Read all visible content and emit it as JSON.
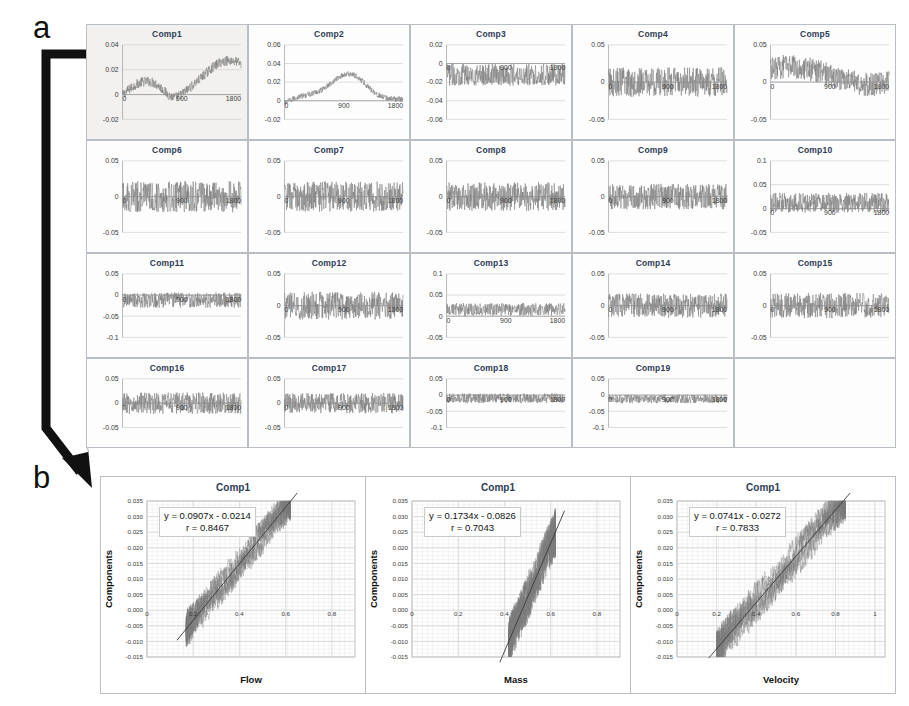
{
  "figure": {
    "panel_a_letter": "a",
    "panel_b_letter": "b",
    "arrow_name": "arrow-from-comp1-to-panel-b"
  },
  "chart_data": [
    {
      "type": "line",
      "title": "Comp1",
      "xlabel": "",
      "ylabel": "",
      "xticks": [
        "0",
        "900",
        "1800"
      ],
      "yticks": [
        "0.04",
        "0.02",
        "0",
        "-0.02"
      ],
      "xlim": [
        0,
        1800
      ],
      "ylim": [
        -0.02,
        0.04
      ],
      "grid": true,
      "series_shape": "rising-trend",
      "noise": 0.004,
      "highlighted": true
    },
    {
      "type": "line",
      "title": "Comp2",
      "xticks": [
        "0",
        "900",
        "1800"
      ],
      "yticks": [
        "0.06",
        "0.04",
        "0.02",
        "0",
        "-0.02"
      ],
      "xlim": [
        0,
        1800
      ],
      "ylim": [
        -0.02,
        0.06
      ],
      "grid": true,
      "series_shape": "hump",
      "noise": 0.003
    },
    {
      "type": "line",
      "title": "Comp3",
      "xticks": [
        "0",
        "900",
        "1800"
      ],
      "yticks": [
        "0.02",
        "0",
        "-0.02",
        "-0.04",
        "-0.06"
      ],
      "xlim": [
        0,
        1800
      ],
      "ylim": [
        -0.06,
        0.02
      ],
      "grid": true,
      "series_shape": "noise",
      "noise": 0.012,
      "baseline": -0.012
    },
    {
      "type": "line",
      "title": "Comp4",
      "xticks": [
        "0",
        "900",
        "1800"
      ],
      "yticks": [
        "0.05",
        "0",
        "-0.05"
      ],
      "xlim": [
        0,
        1800
      ],
      "ylim": [
        -0.05,
        0.05
      ],
      "grid": true,
      "series_shape": "noise",
      "noise": 0.02
    },
    {
      "type": "line",
      "title": "Comp5",
      "xticks": [
        "0",
        "900",
        "1800"
      ],
      "yticks": [
        "0.05",
        "0",
        "-0.05"
      ],
      "xlim": [
        0,
        1800
      ],
      "ylim": [
        -0.05,
        0.05
      ],
      "grid": true,
      "series_shape": "wander",
      "noise": 0.016
    },
    {
      "type": "line",
      "title": "Comp6",
      "xticks": [
        "0",
        "900",
        "1800"
      ],
      "yticks": [
        "0.05",
        "0",
        "-0.05"
      ],
      "xlim": [
        0,
        1800
      ],
      "ylim": [
        -0.05,
        0.05
      ],
      "grid": true,
      "series_shape": "noise",
      "noise": 0.022
    },
    {
      "type": "line",
      "title": "Comp7",
      "xticks": [
        "0",
        "900",
        "1800"
      ],
      "yticks": [
        "0.05",
        "0",
        "-0.05"
      ],
      "xlim": [
        0,
        1800
      ],
      "ylim": [
        -0.05,
        0.05
      ],
      "grid": true,
      "series_shape": "noise",
      "noise": 0.021
    },
    {
      "type": "line",
      "title": "Comp8",
      "xticks": [
        "0",
        "900",
        "1800"
      ],
      "yticks": [
        "0.05",
        "0",
        "-0.05"
      ],
      "xlim": [
        0,
        1800
      ],
      "ylim": [
        -0.05,
        0.05
      ],
      "grid": true,
      "series_shape": "noise",
      "noise": 0.02
    },
    {
      "type": "line",
      "title": "Comp9",
      "xticks": [
        "0",
        "900",
        "1800"
      ],
      "yticks": [
        "0.05",
        "0",
        "-0.05"
      ],
      "xlim": [
        0,
        1800
      ],
      "ylim": [
        -0.05,
        0.05
      ],
      "grid": true,
      "series_shape": "noise",
      "noise": 0.018
    },
    {
      "type": "line",
      "title": "Comp10",
      "xticks": [
        "0",
        "900",
        "1800"
      ],
      "yticks": [
        "0.1",
        "0.05",
        "0",
        "-0.05"
      ],
      "xlim": [
        0,
        1800
      ],
      "ylim": [
        -0.05,
        0.1
      ],
      "grid": true,
      "series_shape": "noise",
      "noise": 0.021,
      "baseline": 0.012
    },
    {
      "type": "line",
      "title": "Comp11",
      "xticks": [
        "0",
        "900",
        "1800"
      ],
      "yticks": [
        "0.05",
        "0",
        "-0.05",
        "-0.1"
      ],
      "xlim": [
        0,
        1800
      ],
      "ylim": [
        -0.1,
        0.05
      ],
      "grid": true,
      "series_shape": "noise",
      "noise": 0.018,
      "baseline": -0.012
    },
    {
      "type": "line",
      "title": "Comp12",
      "xticks": [
        "0",
        "900",
        "1800"
      ],
      "yticks": [
        "0.05",
        "0",
        "-0.05"
      ],
      "xlim": [
        0,
        1800
      ],
      "ylim": [
        -0.05,
        0.05
      ],
      "grid": true,
      "series_shape": "noise",
      "noise": 0.022
    },
    {
      "type": "line",
      "title": "Comp13",
      "xticks": [
        "0",
        "900",
        "1800"
      ],
      "yticks": [
        "0.1",
        "0.05",
        "0",
        "-0.05"
      ],
      "xlim": [
        0,
        1800
      ],
      "ylim": [
        -0.05,
        0.1
      ],
      "grid": true,
      "series_shape": "noise",
      "noise": 0.015,
      "baseline": 0.016
    },
    {
      "type": "line",
      "title": "Comp14",
      "xticks": [
        "0",
        "900",
        "1800"
      ],
      "yticks": [
        "0.05",
        "0",
        "-0.05"
      ],
      "xlim": [
        0,
        1800
      ],
      "ylim": [
        -0.05,
        0.05
      ],
      "grid": true,
      "series_shape": "noise",
      "noise": 0.019
    },
    {
      "type": "line",
      "title": "Comp15",
      "xticks": [
        "0",
        "900",
        "1800"
      ],
      "yticks": [
        "0.05",
        "0",
        "-0.05"
      ],
      "xlim": [
        0,
        1800
      ],
      "ylim": [
        -0.05,
        0.05
      ],
      "grid": true,
      "series_shape": "noise",
      "noise": 0.02
    },
    {
      "type": "line",
      "title": "Comp16",
      "xticks": [
        "0",
        "900",
        "1800"
      ],
      "yticks": [
        "0.05",
        "0",
        "-0.05"
      ],
      "xlim": [
        0,
        1800
      ],
      "ylim": [
        -0.05,
        0.05
      ],
      "grid": true,
      "series_shape": "noise",
      "noise": 0.022
    },
    {
      "type": "line",
      "title": "Comp17",
      "xticks": [
        "0",
        "900",
        "1800"
      ],
      "yticks": [
        "0.05",
        "0",
        "-0.05"
      ],
      "xlim": [
        0,
        1800
      ],
      "ylim": [
        -0.05,
        0.05
      ],
      "grid": true,
      "series_shape": "noise",
      "noise": 0.021
    },
    {
      "type": "line",
      "title": "Comp18",
      "xticks": [
        "0",
        "900",
        "1800"
      ],
      "yticks": [
        "0.05",
        "0",
        "-0.05",
        "-0.1"
      ],
      "xlim": [
        0,
        1800
      ],
      "ylim": [
        -0.1,
        0.05
      ],
      "grid": true,
      "series_shape": "noise",
      "noise": 0.015,
      "baseline": -0.01
    },
    {
      "type": "line",
      "title": "Comp19",
      "xticks": [
        "0",
        "900",
        "1800"
      ],
      "yticks": [
        "0.05",
        "0",
        "-0.05",
        "-0.1"
      ],
      "xlim": [
        0,
        1800
      ],
      "ylim": [
        -0.1,
        0.05
      ],
      "grid": true,
      "series_shape": "noise",
      "noise": 0.013,
      "baseline": -0.012
    },
    {
      "type": "scatter",
      "title": "Comp1",
      "xlabel": "Flow",
      "ylabel": "Components",
      "xticks": [
        "0",
        "0.2",
        "0.4",
        "0.6",
        "0.8"
      ],
      "yticks": [
        "0.035",
        "0.030",
        "0.025",
        "0.020",
        "0.015",
        "0.010",
        "0.005",
        "0.000",
        "-0.005",
        "-0.010",
        "-0.015"
      ],
      "xlim": [
        0,
        0.9
      ],
      "ylim": [
        -0.015,
        0.035
      ],
      "grid": true,
      "equation": "y = 0.0907x - 0.0214",
      "correlation": "r = 0.8467",
      "slope": 0.0907,
      "intercept": -0.0214,
      "r": 0.8467,
      "cloud_x_range": [
        0.17,
        0.62
      ],
      "cloud_spread": 0.0035
    },
    {
      "type": "scatter",
      "title": "Comp1",
      "xlabel": "Mass",
      "ylabel": "Components",
      "xticks": [
        "0",
        "0.2",
        "0.4",
        "0.6",
        "0.8"
      ],
      "yticks": [
        "0.035",
        "0.030",
        "0.025",
        "0.020",
        "0.015",
        "0.010",
        "0.005",
        "0.000",
        "-0.005",
        "-0.010",
        "-0.015"
      ],
      "xlim": [
        0,
        0.9
      ],
      "ylim": [
        -0.015,
        0.035
      ],
      "grid": true,
      "equation": "y = 0.1734x - 0.0826",
      "correlation": "r = 0.7043",
      "slope": 0.1734,
      "intercept": -0.0826,
      "r": 0.7043,
      "cloud_x_range": [
        0.42,
        0.62
      ],
      "cloud_spread": 0.0045
    },
    {
      "type": "scatter",
      "title": "Comp1",
      "xlabel": "Velocity",
      "ylabel": "Components",
      "xticks": [
        "0",
        "0.2",
        "0.4",
        "0.6",
        "0.8",
        "1"
      ],
      "yticks": [
        "0.035",
        "0.030",
        "0.025",
        "0.020",
        "0.015",
        "0.010",
        "0.005",
        "0.000",
        "-0.005",
        "-0.010",
        "-0.015"
      ],
      "xlim": [
        0,
        1.05
      ],
      "ylim": [
        -0.015,
        0.035
      ],
      "grid": true,
      "equation": "y = 0.0741x - 0.0272",
      "correlation": "r = 0.7833",
      "slope": 0.0741,
      "intercept": -0.0272,
      "r": 0.7833,
      "cloud_x_range": [
        0.2,
        0.85
      ],
      "cloud_spread": 0.004
    }
  ],
  "colors": {
    "series": "#7a7a7a",
    "title": "#2d3b55",
    "border": "#b9bec4",
    "grid": "#c8c8c8",
    "trendline": "#3a3a3a"
  }
}
